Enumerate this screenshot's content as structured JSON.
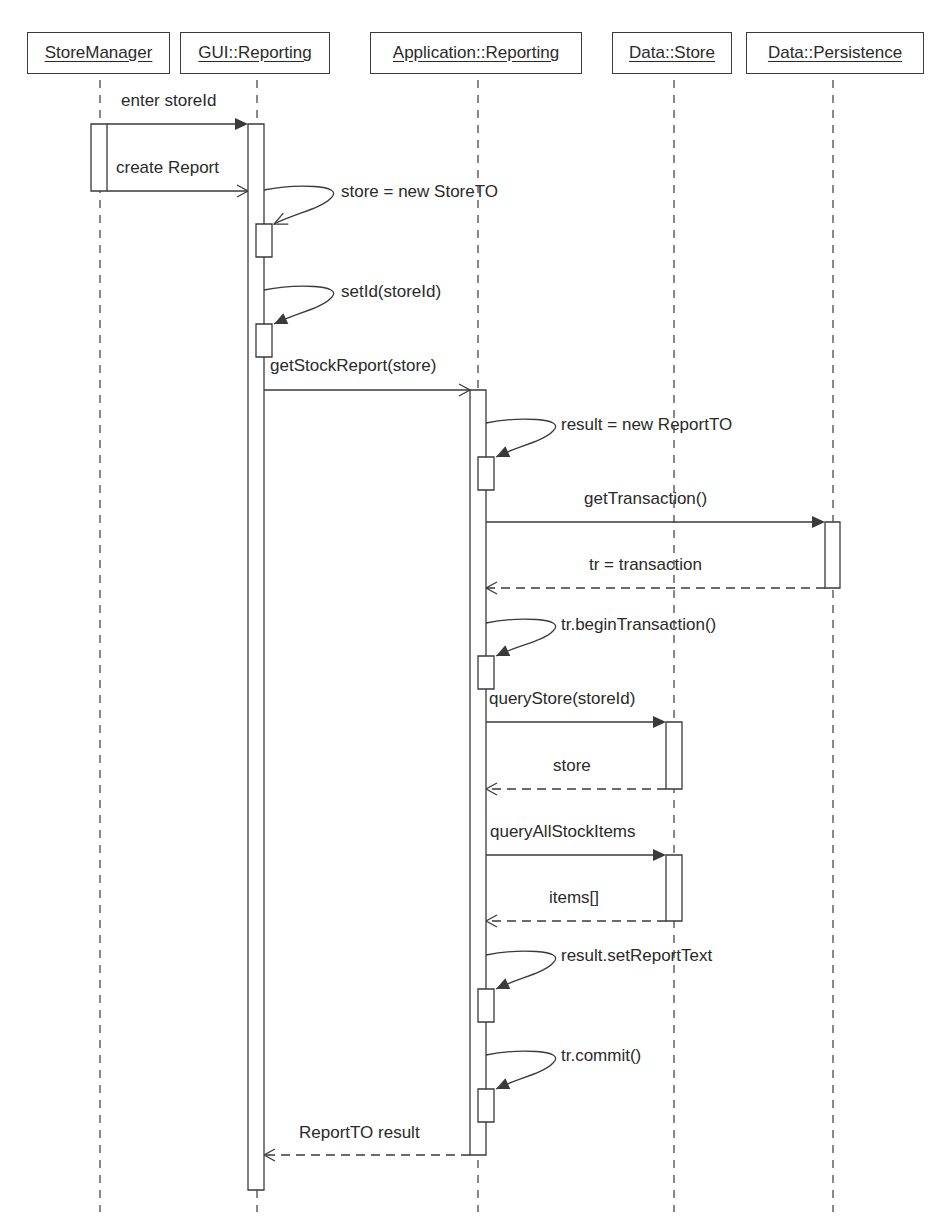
{
  "diagram": {
    "type": "uml-sequence",
    "stroke_color": "#3a3a3a",
    "text_color": "#2a2a2a",
    "background": "#ffffff"
  },
  "lifelines": [
    {
      "id": "storemanager",
      "label": "StoreManager",
      "box": [
        27,
        32,
        143,
        42
      ],
      "x": 100
    },
    {
      "id": "gui-reporting",
      "label": "GUI::Reporting",
      "box": [
        180,
        32,
        150,
        42
      ],
      "x": 257
    },
    {
      "id": "application-reporting",
      "label": "Application::Reporting",
      "box": [
        370,
        32,
        212,
        42
      ],
      "x": 478
    },
    {
      "id": "data-store",
      "label": "Data::Store",
      "box": [
        612,
        32,
        120,
        42
      ],
      "x": 674
    },
    {
      "id": "data-persistence",
      "label": "Data::Persistence",
      "box": [
        746,
        32,
        178,
        42
      ],
      "x": 833
    }
  ],
  "lifeline_end_y": 1212,
  "activations": [
    {
      "lifeline": "storemanager",
      "x": 91,
      "y": 124,
      "w": 16,
      "h": 67
    },
    {
      "lifeline": "gui-reporting",
      "x": 248,
      "y": 124,
      "w": 16,
      "h": 1066
    },
    {
      "lifeline": "gui-reporting",
      "x": 256,
      "y": 224,
      "w": 16,
      "h": 33,
      "nested": true
    },
    {
      "lifeline": "gui-reporting",
      "x": 256,
      "y": 324,
      "w": 16,
      "h": 33,
      "nested": true
    },
    {
      "lifeline": "application-reporting",
      "x": 470,
      "y": 390,
      "w": 16,
      "h": 765
    },
    {
      "lifeline": "application-reporting",
      "x": 478,
      "y": 457,
      "w": 16,
      "h": 33,
      "nested": true
    },
    {
      "lifeline": "data-persistence",
      "x": 825,
      "y": 522,
      "w": 15,
      "h": 66
    },
    {
      "lifeline": "application-reporting",
      "x": 478,
      "y": 656,
      "w": 16,
      "h": 33,
      "nested": true
    },
    {
      "lifeline": "data-store",
      "x": 666,
      "y": 722,
      "w": 16,
      "h": 67
    },
    {
      "lifeline": "data-store",
      "x": 666,
      "y": 855,
      "w": 16,
      "h": 66
    },
    {
      "lifeline": "application-reporting",
      "x": 478,
      "y": 989,
      "w": 16,
      "h": 33,
      "nested": true
    },
    {
      "lifeline": "application-reporting",
      "x": 478,
      "y": 1089,
      "w": 16,
      "h": 33,
      "nested": true
    }
  ],
  "messages": [
    {
      "id": "enter-storeid",
      "label": "enter storeId",
      "kind": "sync",
      "from_x": 107,
      "to_x": 248,
      "y": 124,
      "label_x": 121,
      "label_y": 92
    },
    {
      "id": "create-report",
      "label": "create Report",
      "kind": "async",
      "from_x": 107,
      "to_x": 248,
      "y": 191,
      "label_x": 116,
      "label_y": 159
    },
    {
      "id": "store-new-storeto",
      "label": "store = new StoreTO",
      "kind": "self-async",
      "x": 264,
      "y": 190,
      "end_x": 272,
      "end_y": 224,
      "label_x": 341,
      "label_y": 183
    },
    {
      "id": "setid",
      "label": "setId(storeId)",
      "kind": "self-sync",
      "x": 264,
      "y": 290,
      "end_x": 272,
      "end_y": 324,
      "label_x": 341,
      "label_y": 283
    },
    {
      "id": "getstockreport",
      "label": "getStockReport(store)",
      "kind": "async",
      "from_x": 264,
      "to_x": 470,
      "y": 390,
      "label_x": 270,
      "label_y": 357
    },
    {
      "id": "result-new-reportto",
      "label": "result = new ReportTO",
      "kind": "self-sync",
      "x": 486,
      "y": 423,
      "end_x": 494,
      "end_y": 457,
      "label_x": 561,
      "label_y": 416
    },
    {
      "id": "gettransaction",
      "label": "getTransaction()",
      "kind": "sync",
      "from_x": 486,
      "to_x": 825,
      "y": 522,
      "label_x": 584,
      "label_y": 490
    },
    {
      "id": "tr-transaction",
      "label": "tr = transaction",
      "kind": "return",
      "from_x": 825,
      "to_x": 486,
      "y": 588,
      "label_x": 589,
      "label_y": 556
    },
    {
      "id": "tr-begintransaction",
      "label": "tr.beginTransaction()",
      "kind": "self-sync",
      "x": 486,
      "y": 623,
      "end_x": 494,
      "end_y": 656,
      "label_x": 561,
      "label_y": 616
    },
    {
      "id": "querystore",
      "label": "queryStore(storeId)",
      "kind": "sync",
      "from_x": 486,
      "to_x": 666,
      "y": 722,
      "label_x": 489,
      "label_y": 690
    },
    {
      "id": "store-return",
      "label": "store",
      "kind": "return",
      "from_x": 666,
      "to_x": 486,
      "y": 789,
      "label_x": 553,
      "label_y": 757
    },
    {
      "id": "queryallstockitems",
      "label": "queryAllStockItems",
      "kind": "sync",
      "from_x": 486,
      "to_x": 666,
      "y": 855,
      "label_x": 490,
      "label_y": 823
    },
    {
      "id": "items-return",
      "label": "items[]",
      "kind": "return",
      "from_x": 666,
      "to_x": 486,
      "y": 921,
      "label_x": 549,
      "label_y": 889
    },
    {
      "id": "result-setreporttext",
      "label": "result.setReportText",
      "kind": "self-sync",
      "x": 486,
      "y": 955,
      "end_x": 494,
      "end_y": 989,
      "label_x": 561,
      "label_y": 947
    },
    {
      "id": "tr-commit",
      "label": "tr.commit()",
      "kind": "self-sync",
      "x": 486,
      "y": 1055,
      "end_x": 494,
      "end_y": 1089,
      "label_x": 561,
      "label_y": 1047
    },
    {
      "id": "reportto-result",
      "label": "ReportTO result",
      "kind": "return",
      "from_x": 470,
      "to_x": 264,
      "y": 1155,
      "label_x": 299,
      "label_y": 1124
    }
  ]
}
